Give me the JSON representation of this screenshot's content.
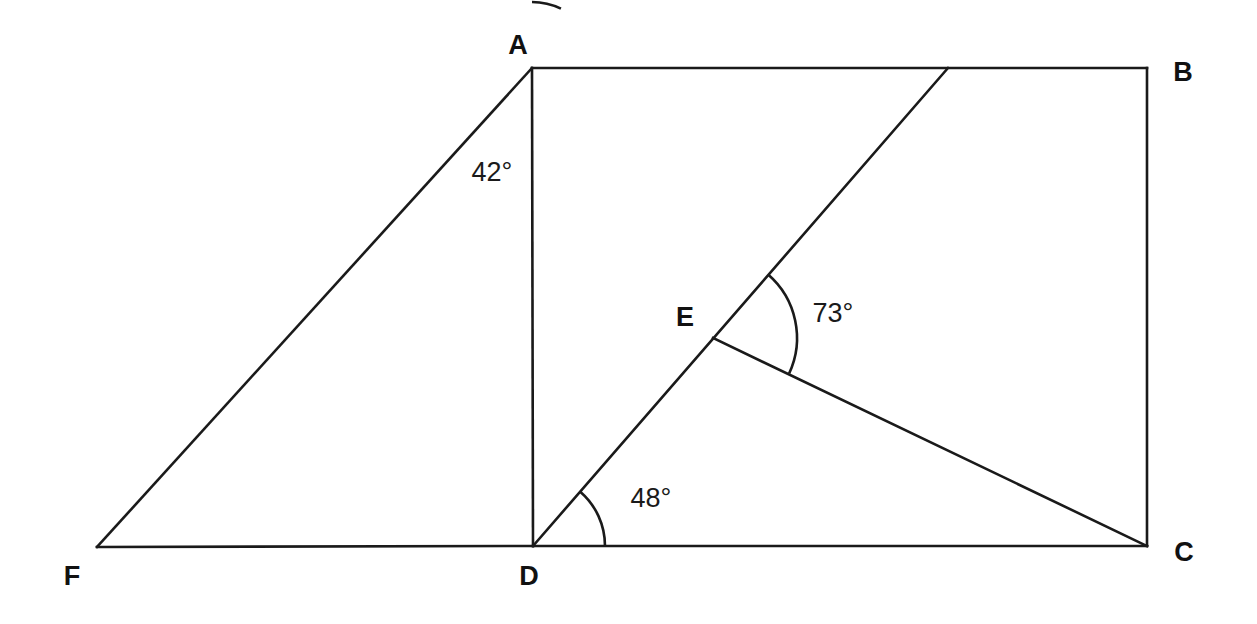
{
  "figure": {
    "kind": "geometry-diagram",
    "background_color": "#ffffff",
    "stroke_color": "#1a1a1a",
    "stroke_width": 2.6,
    "width": 1257,
    "height": 624,
    "vertices": [
      {
        "id": "A",
        "label": "A",
        "x": 532,
        "y": 68,
        "label_x": 518,
        "label_y": 45
      },
      {
        "id": "B",
        "label": "B",
        "x": 1147,
        "y": 68,
        "label_x": 1183,
        "label_y": 72
      },
      {
        "id": "C",
        "label": "C",
        "x": 1147,
        "y": 546,
        "label_x": 1184,
        "label_y": 552
      },
      {
        "id": "D",
        "label": "D",
        "x": 533,
        "y": 546,
        "label_x": 529,
        "label_y": 576
      },
      {
        "id": "E",
        "label": "E",
        "x": 713,
        "y": 338,
        "label_x": 685,
        "label_y": 317
      },
      {
        "id": "F",
        "label": "F",
        "x": 97,
        "y": 547,
        "label_x": 72,
        "label_y": 576
      },
      {
        "id": "G",
        "label": "",
        "x": 948,
        "y": 68,
        "label_x": 948,
        "label_y": 68
      }
    ],
    "segments": [
      {
        "name": "segment-AB",
        "from": "A",
        "to": "B"
      },
      {
        "name": "segment-BC",
        "from": "B",
        "to": "C"
      },
      {
        "name": "segment-CD",
        "from": "C",
        "to": "D"
      },
      {
        "name": "segment-DA",
        "from": "D",
        "to": "A"
      },
      {
        "name": "segment-AF",
        "from": "A",
        "to": "F"
      },
      {
        "name": "segment-FD",
        "from": "F",
        "to": "D"
      },
      {
        "name": "segment-DG-through-E",
        "from": "D",
        "to": "G"
      },
      {
        "name": "segment-EC",
        "from": "E",
        "to": "C"
      }
    ],
    "angles": [
      {
        "name": "angle-at-A",
        "text": "42°",
        "value": 42,
        "vertex": "A",
        "label_x": 492,
        "label_y": 172,
        "arc_radius": 66,
        "start_deg": 64,
        "end_deg": 90
      },
      {
        "name": "angle-at-D",
        "text": "48°",
        "value": 48,
        "vertex": "D",
        "label_x": 651,
        "label_y": 498,
        "arc_radius": 72,
        "start_deg": 0,
        "end_deg": 49
      },
      {
        "name": "angle-at-E",
        "text": "73°",
        "value": 73,
        "vertex": "E",
        "label_x": 833,
        "label_y": 313,
        "arc_radius": 84,
        "start_deg": -25,
        "end_deg": 49
      }
    ]
  }
}
